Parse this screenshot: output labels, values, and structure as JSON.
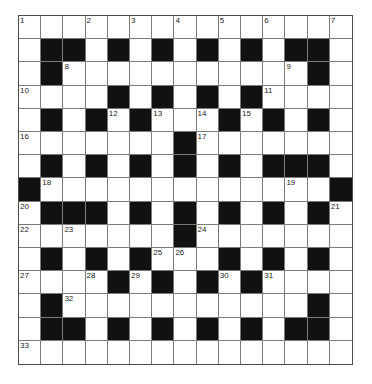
{
  "puzzle": {
    "rows": 15,
    "cols": 15,
    "colors": {
      "black_cell": "#111111",
      "white_cell": "#ffffff",
      "grid_line": "#7a7a7a",
      "number_text": "#222222"
    },
    "grid": [
      "...............",
      ".##.#.#.#.#.##.",
      ".#...........#.",
      "....#.#.#.#....",
      ".#.#.#...#.#.#.",
      ".......#.......",
      ".#.#.#.#.#.###.",
      "#.............#",
      ".###.#.#.#.#.#.",
      ".......#.......",
      ".#.#.#...#.#.#.",
      "....#.#.#.#....",
      ".#...........#.",
      ".##.#.#.#.#.##.",
      "..............."
    ],
    "numbers": [
      {
        "n": "1",
        "r": 0,
        "c": 0
      },
      {
        "n": "2",
        "r": 0,
        "c": 3
      },
      {
        "n": "3",
        "r": 0,
        "c": 5
      },
      {
        "n": "4",
        "r": 0,
        "c": 7
      },
      {
        "n": "5",
        "r": 0,
        "c": 9
      },
      {
        "n": "6",
        "r": 0,
        "c": 11
      },
      {
        "n": "7",
        "r": 0,
        "c": 14
      },
      {
        "n": "8",
        "r": 2,
        "c": 2
      },
      {
        "n": "9",
        "r": 2,
        "c": 12
      },
      {
        "n": "10",
        "r": 3,
        "c": 0
      },
      {
        "n": "11",
        "r": 3,
        "c": 11
      },
      {
        "n": "12",
        "r": 4,
        "c": 4
      },
      {
        "n": "13",
        "r": 4,
        "c": 6
      },
      {
        "n": "14",
        "r": 4,
        "c": 8
      },
      {
        "n": "15",
        "r": 4,
        "c": 10
      },
      {
        "n": "16",
        "r": 5,
        "c": 0
      },
      {
        "n": "17",
        "r": 5,
        "c": 8
      },
      {
        "n": "18",
        "r": 7,
        "c": 1
      },
      {
        "n": "19",
        "r": 7,
        "c": 12
      },
      {
        "n": "20",
        "r": 8,
        "c": 0
      },
      {
        "n": "21",
        "r": 8,
        "c": 14
      },
      {
        "n": "22",
        "r": 9,
        "c": 0
      },
      {
        "n": "23",
        "r": 9,
        "c": 2
      },
      {
        "n": "24",
        "r": 9,
        "c": 8
      },
      {
        "n": "25",
        "r": 10,
        "c": 6
      },
      {
        "n": "26",
        "r": 10,
        "c": 7
      },
      {
        "n": "27",
        "r": 11,
        "c": 0
      },
      {
        "n": "28",
        "r": 11,
        "c": 3
      },
      {
        "n": "29",
        "r": 11,
        "c": 5
      },
      {
        "n": "30",
        "r": 11,
        "c": 9
      },
      {
        "n": "31",
        "r": 11,
        "c": 11
      },
      {
        "n": "32",
        "r": 12,
        "c": 2
      },
      {
        "n": "33",
        "r": 14,
        "c": 0
      }
    ],
    "letters": []
  }
}
